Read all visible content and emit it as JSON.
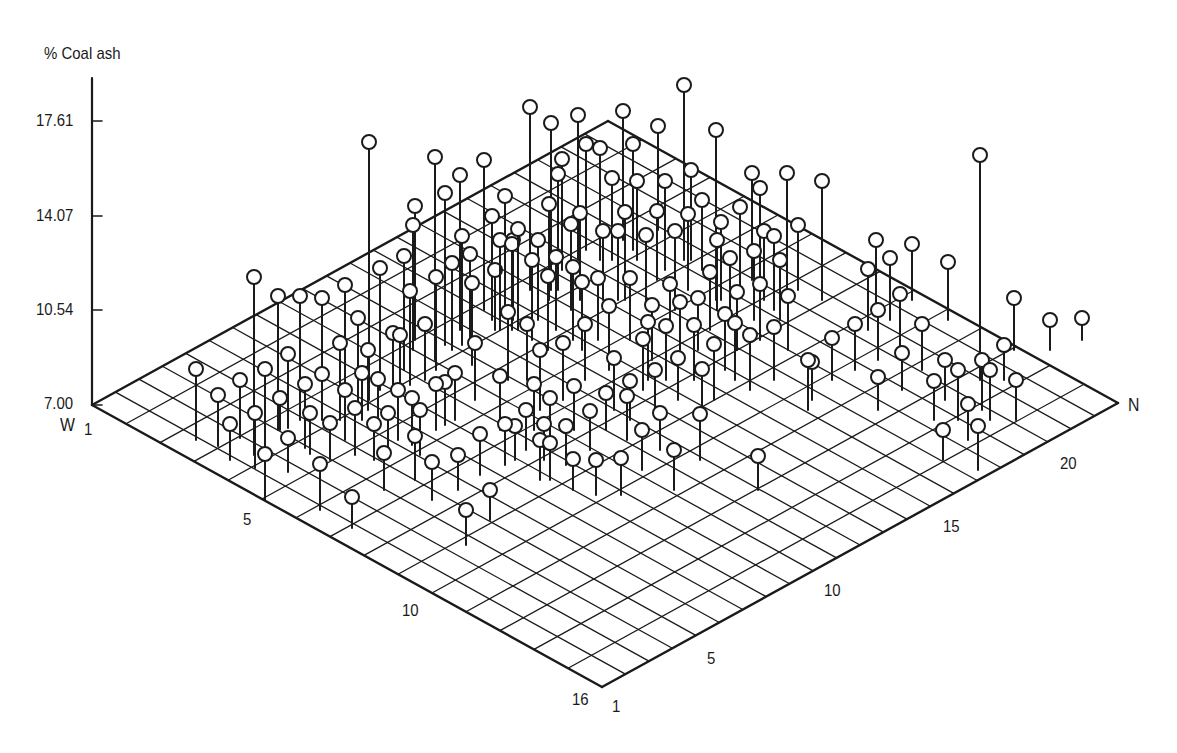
{
  "chart_data": {
    "type": "scatter",
    "subtype": "3d-stem",
    "title": "",
    "zlabel": "% Coal ash",
    "xlabel": "W",
    "ylabel": "N",
    "z_ticks": [
      "7.00",
      "10.54",
      "14.07",
      "17.61"
    ],
    "z_range": [
      7.0,
      17.61
    ],
    "w_ticks": [
      "1",
      "5",
      "10",
      "16"
    ],
    "w_range": [
      1,
      16
    ],
    "n_ticks": [
      "1",
      "5",
      "10",
      "15",
      "20"
    ],
    "n_range": [
      1,
      23
    ],
    "grid": true,
    "marker": "open-circle",
    "point_count_approx": 208,
    "points_screen": [
      [
        196,
        369,
        440
      ],
      [
        218,
        395,
        446
      ],
      [
        230,
        424,
        460
      ],
      [
        240,
        380,
        438
      ],
      [
        254,
        277,
        455
      ],
      [
        255,
        413,
        468
      ],
      [
        265,
        454,
        500
      ],
      [
        265,
        369,
        455
      ],
      [
        278,
        296,
        430
      ],
      [
        280,
        398,
        430
      ],
      [
        288,
        438,
        472
      ],
      [
        288,
        354,
        428
      ],
      [
        300,
        296,
        420
      ],
      [
        305,
        384,
        448
      ],
      [
        310,
        413,
        454
      ],
      [
        320,
        464,
        510
      ],
      [
        322,
        298,
        410
      ],
      [
        322,
        374,
        420
      ],
      [
        330,
        423,
        460
      ],
      [
        340,
        343,
        420
      ],
      [
        345,
        390,
        440
      ],
      [
        352,
        497,
        528
      ],
      [
        355,
        408,
        455
      ],
      [
        345,
        285,
        390
      ],
      [
        358,
        318,
        405
      ],
      [
        362,
        373,
        420
      ],
      [
        369,
        142,
        400
      ],
      [
        368,
        350,
        410
      ],
      [
        374,
        424,
        460
      ],
      [
        378,
        379,
        425
      ],
      [
        380,
        268,
        390
      ],
      [
        384,
        453,
        490
      ],
      [
        388,
        413,
        455
      ],
      [
        393,
        333,
        395
      ],
      [
        398,
        390,
        440
      ],
      [
        400,
        335,
        395
      ],
      [
        404,
        256,
        370
      ],
      [
        410,
        291,
        385
      ],
      [
        412,
        398,
        445
      ],
      [
        415,
        436,
        480
      ],
      [
        420,
        410,
        455
      ],
      [
        413,
        225,
        350
      ],
      [
        415,
        206,
        340
      ],
      [
        425,
        324,
        380
      ],
      [
        432,
        462,
        500
      ],
      [
        435,
        157,
        360
      ],
      [
        436,
        384,
        430
      ],
      [
        436,
        277,
        370
      ],
      [
        445,
        193,
        345
      ],
      [
        445,
        382,
        425
      ],
      [
        452,
        263,
        350
      ],
      [
        455,
        373,
        420
      ],
      [
        458,
        455,
        490
      ],
      [
        460,
        175,
        330
      ],
      [
        466,
        510,
        545
      ],
      [
        462,
        236,
        345
      ],
      [
        470,
        254,
        340
      ],
      [
        472,
        283,
        365
      ],
      [
        475,
        343,
        400
      ],
      [
        480,
        434,
        475
      ],
      [
        484,
        160,
        310
      ],
      [
        490,
        490,
        520
      ],
      [
        492,
        216,
        320
      ],
      [
        495,
        270,
        330
      ],
      [
        500,
        376,
        430
      ],
      [
        500,
        240,
        330
      ],
      [
        505,
        196,
        310
      ],
      [
        505,
        424,
        465
      ],
      [
        508,
        312,
        380
      ],
      [
        512,
        244,
        330
      ],
      [
        513,
        240,
        320
      ],
      [
        515,
        426,
        460
      ],
      [
        518,
        229,
        330
      ],
      [
        526,
        410,
        450
      ],
      [
        527,
        324,
        380
      ],
      [
        530,
        107,
        290
      ],
      [
        532,
        260,
        340
      ],
      [
        534,
        384,
        430
      ],
      [
        540,
        350,
        410
      ],
      [
        540,
        440,
        480
      ],
      [
        538,
        240,
        320
      ],
      [
        544,
        424,
        460
      ],
      [
        550,
        398,
        440
      ],
      [
        549,
        204,
        300
      ],
      [
        548,
        276,
        350
      ],
      [
        551,
        123,
        290
      ],
      [
        550,
        443,
        480
      ],
      [
        556,
        257,
        330
      ],
      [
        558,
        174,
        290
      ],
      [
        562,
        159,
        270
      ],
      [
        563,
        343,
        400
      ],
      [
        566,
        426,
        465
      ],
      [
        571,
        224,
        310
      ],
      [
        573,
        267,
        340
      ],
      [
        573,
        459,
        490
      ],
      [
        574,
        386,
        430
      ],
      [
        578,
        115,
        260
      ],
      [
        580,
        213,
        300
      ],
      [
        582,
        282,
        350
      ],
      [
        585,
        324,
        380
      ],
      [
        586,
        144,
        250
      ],
      [
        590,
        411,
        450
      ],
      [
        596,
        460,
        495
      ],
      [
        598,
        278,
        340
      ],
      [
        600,
        148,
        260
      ],
      [
        603,
        231,
        300
      ],
      [
        606,
        393,
        430
      ],
      [
        609,
        306,
        370
      ],
      [
        612,
        178,
        260
      ],
      [
        614,
        358,
        410
      ],
      [
        618,
        231,
        300
      ],
      [
        621,
        458,
        495
      ],
      [
        623,
        111,
        240
      ],
      [
        625,
        212,
        300
      ],
      [
        627,
        396,
        440
      ],
      [
        630,
        381,
        420
      ],
      [
        630,
        278,
        340
      ],
      [
        633,
        144,
        250
      ],
      [
        637,
        181,
        260
      ],
      [
        642,
        430,
        470
      ],
      [
        643,
        339,
        390
      ],
      [
        646,
        235,
        300
      ],
      [
        648,
        322,
        380
      ],
      [
        652,
        305,
        360
      ],
      [
        658,
        126,
        230
      ],
      [
        655,
        370,
        410
      ],
      [
        657,
        211,
        280
      ],
      [
        660,
        413,
        450
      ],
      [
        665,
        181,
        270
      ],
      [
        666,
        326,
        380
      ],
      [
        670,
        284,
        330
      ],
      [
        674,
        450,
        490
      ],
      [
        675,
        231,
        310
      ],
      [
        678,
        358,
        400
      ],
      [
        680,
        302,
        350
      ],
      [
        684,
        85,
        260
      ],
      [
        688,
        214,
        290
      ],
      [
        691,
        170,
        260
      ],
      [
        694,
        325,
        380
      ],
      [
        698,
        298,
        350
      ],
      [
        700,
        414,
        460
      ],
      [
        702,
        200,
        270
      ],
      [
        702,
        369,
        410
      ],
      [
        710,
        272,
        330
      ],
      [
        714,
        344,
        400
      ],
      [
        716,
        130,
        300
      ],
      [
        717,
        240,
        310
      ],
      [
        721,
        222,
        300
      ],
      [
        725,
        314,
        370
      ],
      [
        730,
        258,
        320
      ],
      [
        735,
        323,
        380
      ],
      [
        737,
        292,
        350
      ],
      [
        740,
        207,
        290
      ],
      [
        752,
        173,
        280
      ],
      [
        750,
        335,
        390
      ],
      [
        754,
        251,
        320
      ],
      [
        758,
        456,
        490
      ],
      [
        760,
        188,
        280
      ],
      [
        760,
        284,
        340
      ],
      [
        764,
        231,
        300
      ],
      [
        774,
        236,
        310
      ],
      [
        774,
        327,
        380
      ],
      [
        780,
        260,
        320
      ],
      [
        787,
        173,
        290
      ],
      [
        788,
        296,
        350
      ],
      [
        798,
        225,
        290
      ],
      [
        808,
        360,
        410
      ],
      [
        812,
        362,
        400
      ],
      [
        822,
        181,
        300
      ],
      [
        832,
        338,
        380
      ],
      [
        855,
        324,
        370
      ],
      [
        868,
        269,
        330
      ],
      [
        876,
        240,
        310
      ],
      [
        878,
        377,
        410
      ],
      [
        878,
        310,
        360
      ],
      [
        890,
        258,
        320
      ],
      [
        900,
        294,
        350
      ],
      [
        902,
        353,
        390
      ],
      [
        912,
        244,
        300
      ],
      [
        922,
        324,
        370
      ],
      [
        934,
        381,
        420
      ],
      [
        943,
        430,
        460
      ],
      [
        945,
        360,
        400
      ],
      [
        948,
        262,
        320
      ],
      [
        958,
        370,
        420
      ],
      [
        968,
        404,
        440
      ],
      [
        980,
        155,
        380
      ],
      [
        982,
        360,
        410
      ],
      [
        978,
        426,
        470
      ],
      [
        990,
        370,
        420
      ],
      [
        1004,
        345,
        380
      ],
      [
        1014,
        298,
        350
      ],
      [
        1016,
        380,
        420
      ],
      [
        1050,
        320,
        350
      ],
      [
        1082,
        318,
        340
      ]
    ]
  },
  "axes": {
    "z_label": "% Coal ash",
    "z_tick_labels": [
      "17.61",
      "14.07",
      "10.54",
      "7.00"
    ],
    "w_label": "W",
    "w_tick_labels": [
      "1",
      "5",
      "10",
      "16"
    ],
    "n_label": "N",
    "n_tick_labels": [
      "1",
      "5",
      "10",
      "15",
      "20"
    ]
  },
  "geometry": {
    "corner_w1_n1": [
      92,
      405
    ],
    "corner_w16_n1": [
      602,
      687
    ],
    "corner_w1_n23": [
      608,
      121
    ],
    "corner_w16_n23": [
      1118,
      403
    ],
    "w_steps": 15,
    "n_steps": 22,
    "z_axis_x": 92,
    "z_axis_top": 78,
    "z_tick_y": [
      121,
      216,
      310,
      405
    ]
  },
  "colors": {
    "ink": "#1a1a1a",
    "background": "#ffffff",
    "marker_fill": "#ffffff"
  }
}
